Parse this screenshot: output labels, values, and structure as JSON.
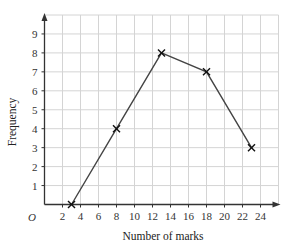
{
  "chart_data": {
    "type": "line",
    "title": "",
    "xlabel": "Number of marks",
    "ylabel": "Frequency",
    "origin_label": "O",
    "x": [
      3,
      8,
      13,
      18,
      23
    ],
    "series": [
      {
        "name": "Frequency polygon",
        "values": [
          0,
          4,
          8,
          7,
          3
        ],
        "marker": "x"
      }
    ],
    "xlim": [
      0,
      26
    ],
    "ylim": [
      0,
      10
    ],
    "x_ticks": [
      2,
      4,
      6,
      8,
      10,
      12,
      14,
      16,
      18,
      20,
      22,
      24
    ],
    "y_ticks": [
      1,
      2,
      3,
      4,
      5,
      6,
      7,
      8,
      9
    ],
    "grid": true,
    "legend": null
  },
  "colors": {
    "grid": "#d4d4d4",
    "axis": "#333333",
    "line": "#444444",
    "marker": "#111111"
  }
}
